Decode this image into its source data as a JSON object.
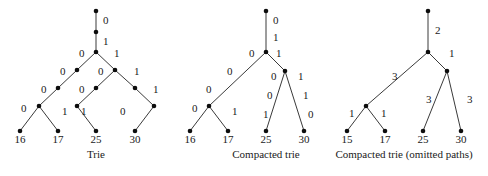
{
  "figure": {
    "width": 488,
    "height": 176,
    "background": "#ffffff",
    "ink": "#1a1a1a",
    "edge_color": "#3a3a3a",
    "node_color": "#0d0d0d"
  },
  "chart_data": {
    "type": "diagram",
    "title": "",
    "panels": [
      {
        "id": "trie",
        "caption": "Trie",
        "caption_pos": [
          96,
          158
        ],
        "nodes": [
          {
            "id": "r",
            "x": 96,
            "y": 11
          },
          {
            "id": "a",
            "x": 96,
            "y": 32
          },
          {
            "id": "b",
            "x": 96,
            "y": 52
          },
          {
            "id": "L1",
            "x": 77,
            "y": 70
          },
          {
            "id": "L2",
            "x": 58,
            "y": 88
          },
          {
            "id": "L3",
            "x": 39,
            "y": 106
          },
          {
            "id": "l16",
            "x": 20,
            "y": 131
          },
          {
            "id": "l17",
            "x": 58,
            "y": 131
          },
          {
            "id": "R1",
            "x": 115,
            "y": 70
          },
          {
            "id": "R2",
            "x": 96,
            "y": 88
          },
          {
            "id": "R3",
            "x": 77,
            "y": 106
          },
          {
            "id": "l25",
            "x": 96,
            "y": 131
          },
          {
            "id": "R4",
            "x": 135,
            "y": 88
          },
          {
            "id": "R5",
            "x": 154,
            "y": 106
          },
          {
            "id": "l30",
            "x": 135,
            "y": 131
          }
        ],
        "edges": [
          {
            "from": "r",
            "to": "a",
            "label": "0",
            "lx": 103,
            "ly": 24
          },
          {
            "from": "a",
            "to": "b",
            "label": "1",
            "lx": 103,
            "ly": 45
          },
          {
            "from": "b",
            "to": "L1",
            "label": "0",
            "lx": 79,
            "ly": 57
          },
          {
            "from": "L1",
            "to": "L2",
            "label": "0",
            "lx": 60,
            "ly": 75
          },
          {
            "from": "L2",
            "to": "L3",
            "label": "0",
            "lx": 41,
            "ly": 93
          },
          {
            "from": "L3",
            "to": "l16",
            "label": "0",
            "lx": 21,
            "ly": 112
          },
          {
            "from": "L3",
            "to": "l17",
            "label": "1",
            "lx": 62,
            "ly": 115
          },
          {
            "from": "b",
            "to": "R1",
            "label": "1",
            "lx": 114,
            "ly": 57
          },
          {
            "from": "R1",
            "to": "R2",
            "label": "0",
            "lx": 98,
            "ly": 75
          },
          {
            "from": "R2",
            "to": "R3",
            "label": "0",
            "lx": 79,
            "ly": 93
          },
          {
            "from": "R3",
            "to": "l25",
            "label": "1",
            "lx": 81,
            "ly": 115
          },
          {
            "from": "R1",
            "to": "R4",
            "label": "1",
            "lx": 134,
            "ly": 75
          },
          {
            "from": "R4",
            "to": "R5",
            "label": "1",
            "lx": 153,
            "ly": 93
          },
          {
            "from": "R5",
            "to": "l30",
            "label": "0",
            "lx": 120,
            "ly": 115
          }
        ],
        "leaves": [
          {
            "node": "l16",
            "label": "16",
            "x": 20,
            "y": 143
          },
          {
            "node": "l17",
            "label": "17",
            "x": 58,
            "y": 143
          },
          {
            "node": "l25",
            "label": "25",
            "x": 96,
            "y": 143
          },
          {
            "node": "l30",
            "label": "30",
            "x": 135,
            "y": 143
          }
        ]
      },
      {
        "id": "compacted-trie",
        "caption": "Compacted trie",
        "caption_pos": [
          266,
          158
        ],
        "nodes": [
          {
            "id": "r",
            "x": 266,
            "y": 11
          },
          {
            "id": "a",
            "x": 266,
            "y": 52
          },
          {
            "id": "L1",
            "x": 209,
            "y": 106
          },
          {
            "id": "l16",
            "x": 190,
            "y": 131
          },
          {
            "id": "l17",
            "x": 228,
            "y": 131
          },
          {
            "id": "R1",
            "x": 285,
            "y": 71
          },
          {
            "id": "l25",
            "x": 266,
            "y": 131
          },
          {
            "id": "l30",
            "x": 304,
            "y": 131
          }
        ],
        "edges": [
          {
            "from": "r",
            "to": "a",
            "label": "0",
            "lx": 273,
            "ly": 24
          },
          {
            "from": "r",
            "to": "a",
            "label": "1",
            "lx": 273,
            "ly": 41
          },
          {
            "from": "a",
            "to": "L1",
            "label": "0",
            "lx": 249,
            "ly": 57
          },
          {
            "from": "a",
            "to": "L1",
            "label": "0",
            "lx": 227,
            "ly": 75
          },
          {
            "from": "a",
            "to": "L1",
            "label": "0",
            "lx": 206,
            "ly": 93
          },
          {
            "from": "L1",
            "to": "l16",
            "label": "0",
            "lx": 192,
            "ly": 112
          },
          {
            "from": "L1",
            "to": "l17",
            "label": "1",
            "lx": 232,
            "ly": 115
          },
          {
            "from": "a",
            "to": "R1",
            "label": "1",
            "lx": 276,
            "ly": 57
          },
          {
            "from": "R1",
            "to": "l25",
            "label": "0",
            "lx": 271,
            "ly": 80
          },
          {
            "from": "R1",
            "to": "l25",
            "label": "0",
            "lx": 267,
            "ly": 99
          },
          {
            "from": "R1",
            "to": "l25",
            "label": "1",
            "lx": 263,
            "ly": 118
          },
          {
            "from": "R1",
            "to": "l30",
            "label": "1",
            "lx": 298,
            "ly": 80
          },
          {
            "from": "R1",
            "to": "l30",
            "label": "1",
            "lx": 303,
            "ly": 99
          },
          {
            "from": "R1",
            "to": "l30",
            "label": "0",
            "lx": 308,
            "ly": 118
          }
        ],
        "leaves": [
          {
            "node": "l16",
            "label": "16",
            "x": 190,
            "y": 143
          },
          {
            "node": "l17",
            "label": "17",
            "x": 228,
            "y": 143
          },
          {
            "node": "l25",
            "label": "25",
            "x": 266,
            "y": 143
          },
          {
            "node": "l30",
            "label": "30",
            "x": 304,
            "y": 143
          }
        ]
      },
      {
        "id": "compacted-trie-omitted",
        "caption": "Compacted trie (omitted paths)",
        "caption_pos": [
          404,
          158
        ],
        "nodes": [
          {
            "id": "r",
            "x": 428,
            "y": 11
          },
          {
            "id": "a",
            "x": 428,
            "y": 52
          },
          {
            "id": "L1",
            "x": 366,
            "y": 106
          },
          {
            "id": "l15",
            "x": 347,
            "y": 131
          },
          {
            "id": "l17",
            "x": 385,
            "y": 131
          },
          {
            "id": "R1",
            "x": 447,
            "y": 71
          },
          {
            "id": "l25",
            "x": 423,
            "y": 131
          },
          {
            "id": "l30",
            "x": 461,
            "y": 131
          }
        ],
        "edges": [
          {
            "from": "r",
            "to": "a",
            "label": "2",
            "lx": 435,
            "ly": 34
          },
          {
            "from": "a",
            "to": "L1",
            "label": "3",
            "lx": 392,
            "ly": 80
          },
          {
            "from": "L1",
            "to": "l15",
            "label": "1",
            "lx": 349,
            "ly": 117
          },
          {
            "from": "L1",
            "to": "l17",
            "label": "1",
            "lx": 381,
            "ly": 117
          },
          {
            "from": "a",
            "to": "R1",
            "label": "1",
            "lx": 449,
            "ly": 57
          },
          {
            "from": "R1",
            "to": "l25",
            "label": "3",
            "lx": 426,
            "ly": 103
          },
          {
            "from": "R1",
            "to": "l30",
            "label": "3",
            "lx": 467,
            "ly": 103
          }
        ],
        "leaves": [
          {
            "node": "l15",
            "label": "15",
            "x": 347,
            "y": 143
          },
          {
            "node": "l17",
            "label": "17",
            "x": 385,
            "y": 143
          },
          {
            "node": "l25",
            "label": "25",
            "x": 423,
            "y": 143
          },
          {
            "node": "l30",
            "label": "30",
            "x": 461,
            "y": 143
          }
        ]
      }
    ]
  }
}
